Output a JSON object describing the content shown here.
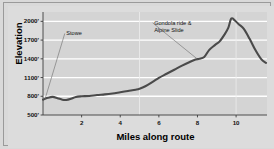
{
  "chart_data": {
    "type": "line",
    "title": "",
    "xlabel": "Miles along route",
    "ylabel": "Elevation",
    "xlim": [
      0,
      11.6
    ],
    "ylim": [
      500,
      2150
    ],
    "grid": true,
    "legend_position": "none",
    "x_ticks": [
      2,
      4,
      6,
      8,
      10
    ],
    "x_tick_labels": [
      "2",
      "4",
      "6",
      "8",
      "10"
    ],
    "y_ticks": [
      500,
      800,
      1100,
      1400,
      1700,
      2000
    ],
    "y_tick_labels": [
      "500'",
      "800'",
      "1100'",
      "1400'",
      "1700'",
      "2000'"
    ],
    "vertical_gridlines": [
      5,
      10
    ],
    "series": [
      {
        "name": "Elevation profile",
        "color": "#4a4a4a",
        "x": [
          0.0,
          0.25,
          0.5,
          0.75,
          1.0,
          1.2,
          1.45,
          1.7,
          2.0,
          2.4,
          2.8,
          3.2,
          3.6,
          4.0,
          4.4,
          4.8,
          5.0,
          5.3,
          5.7,
          6.0,
          6.4,
          6.8,
          7.2,
          7.6,
          7.9,
          8.1,
          8.35,
          8.6,
          8.9,
          9.15,
          9.4,
          9.6,
          9.75,
          9.95,
          10.15,
          10.4,
          10.7,
          11.0,
          11.3,
          11.55
        ],
        "y": [
          745,
          775,
          790,
          770,
          745,
          740,
          760,
          790,
          800,
          805,
          820,
          830,
          845,
          865,
          885,
          905,
          920,
          960,
          1035,
          1095,
          1160,
          1225,
          1290,
          1350,
          1390,
          1400,
          1430,
          1540,
          1620,
          1680,
          1790,
          1900,
          2045,
          2010,
          1950,
          1880,
          1720,
          1540,
          1395,
          1335
        ]
      }
    ],
    "annotations": [
      {
        "id": "stowe",
        "text": "Stowe",
        "lines": [
          "Stowe"
        ],
        "point_x": 0.1,
        "point_y": 750,
        "label_x": 1.05,
        "label_y": 1790
      },
      {
        "id": "gondola",
        "text": "Gondola ride & Alpine Slide",
        "lines": [
          "Gondola ride &",
          "Alpine Slide"
        ],
        "point_x": 8.0,
        "point_y": 1395,
        "label_x": 5.6,
        "label_y": 1960
      }
    ],
    "colors": {
      "figure_background": "#d9d9d9",
      "plot_background": "#d4d4d4",
      "gridline": "#ffffff",
      "vertical_gridline": "#ededed",
      "line": "#4a4a4a",
      "axis": "#3c3c3c",
      "frame_border": "#9a9a9a",
      "text": "#111111"
    }
  }
}
